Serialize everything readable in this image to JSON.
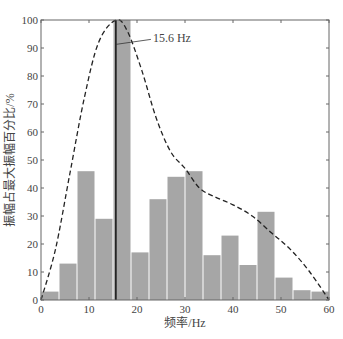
{
  "chart_data": {
    "type": "bar",
    "title": "",
    "xlabel": "频率/Hz",
    "ylabel": "振幅占最大振幅百分比/%",
    "xlim": [
      0,
      60
    ],
    "ylim": [
      0,
      100
    ],
    "x_ticks": [
      0,
      10,
      20,
      30,
      40,
      50,
      60
    ],
    "y_ticks": [
      0,
      10,
      20,
      30,
      40,
      50,
      60,
      70,
      80,
      90,
      100
    ],
    "grid": false,
    "legend": null,
    "bin_width": 3.75,
    "bin_edges": [
      0,
      3.75,
      7.5,
      11.25,
      15,
      18.75,
      22.5,
      26.25,
      30,
      33.75,
      37.5,
      41.25,
      45,
      48.75,
      52.5,
      56.25,
      60
    ],
    "values": [
      3,
      13,
      46,
      29,
      100,
      17,
      36,
      44,
      46,
      16,
      23,
      12.5,
      31.5,
      8,
      3.5,
      3
    ],
    "bar_color": "#a6a6a6",
    "envelope": {
      "style": "dashed",
      "description": "smooth envelope curve",
      "points": [
        [
          0,
          0
        ],
        [
          3,
          18
        ],
        [
          6,
          45
        ],
        [
          9,
          72
        ],
        [
          12,
          92
        ],
        [
          15.6,
          100
        ],
        [
          18,
          96
        ],
        [
          21,
          82
        ],
        [
          24,
          65
        ],
        [
          27,
          53
        ],
        [
          30,
          47
        ],
        [
          33,
          40
        ],
        [
          36,
          37
        ],
        [
          40,
          34
        ],
        [
          44,
          30
        ],
        [
          48,
          24
        ],
        [
          52,
          18
        ],
        [
          56,
          10
        ],
        [
          60,
          0
        ]
      ]
    },
    "marker_line": {
      "x": 15.6,
      "style": "solid",
      "color": "#111111"
    },
    "annotations": [
      {
        "text": "15.6 Hz",
        "x": 15.6,
        "y": 92
      }
    ]
  }
}
